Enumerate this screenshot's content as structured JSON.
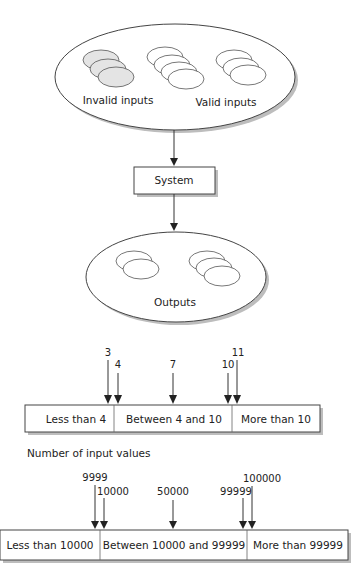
{
  "diagram": {
    "inputs_ellipse": {
      "invalid_label": "Invalid inputs",
      "valid_label": "Valid inputs"
    },
    "system_box": {
      "label": "System"
    },
    "outputs_ellipse": {
      "label": "Outputs"
    },
    "partition_1": {
      "segments": [
        "Less than 4",
        "Between 4 and 10",
        "More than 10"
      ],
      "test_values": [
        "3",
        "4",
        "7",
        "10",
        "11"
      ]
    },
    "partition_2_caption": "Number of input values",
    "partition_2": {
      "segments": [
        "Less than 10000",
        "Between 10000 and 99999",
        "More than 99999"
      ],
      "test_values": [
        "9999",
        "10000",
        "50000",
        "99999",
        "100000"
      ]
    },
    "colors": {
      "invalid_fill": "#e4e4e4",
      "stroke": "#444444",
      "shadow": "#bdbdbd"
    }
  }
}
